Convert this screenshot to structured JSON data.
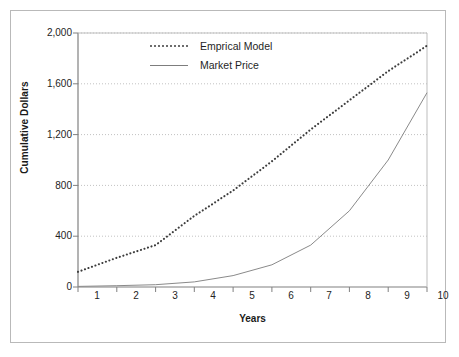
{
  "figure": {
    "background_color": "#ffffff",
    "frame_color": "#b9b9b9"
  },
  "chart_data": {
    "type": "line",
    "title": "",
    "xlabel": "Years",
    "ylabel": "Cumulative Dollars",
    "x": [
      1,
      2,
      3,
      4,
      5,
      6,
      7,
      8,
      9,
      10
    ],
    "xlim": [
      1,
      10
    ],
    "ylim": [
      0,
      2000
    ],
    "x_tick_labels": [
      "1",
      "2",
      "3",
      "4",
      "5",
      "6",
      "7",
      "8",
      "9",
      "10"
    ],
    "y_ticks": [
      0,
      400,
      800,
      1200,
      1600,
      2000
    ],
    "y_tick_labels": [
      "0",
      "400",
      "800",
      "1,200",
      "1,600",
      "2,000"
    ],
    "grid": "horizontal-dotted",
    "legend_position": "upper-left-inside",
    "series": [
      {
        "name": "Emprical Model",
        "style": "dotted",
        "color": "#4a4a4a",
        "values": [
          120,
          230,
          330,
          560,
          760,
          990,
          1240,
          1470,
          1700,
          1900
        ]
      },
      {
        "name": "Market Price",
        "style": "solid",
        "color": "#7d7d7d",
        "values": [
          5,
          10,
          18,
          40,
          90,
          175,
          330,
          600,
          1000,
          1530
        ]
      }
    ]
  },
  "axes": {
    "y_title": "Cumulative Dollars",
    "x_title": "Years"
  },
  "legend": {
    "items": [
      {
        "label": "Emprical Model",
        "swatch": "dotted-line-swatch"
      },
      {
        "label": "Market Price",
        "swatch": "solid-line-swatch"
      }
    ]
  }
}
